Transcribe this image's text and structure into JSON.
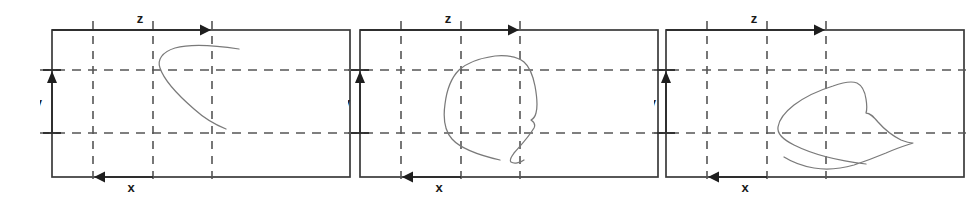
{
  "figure": {
    "title": "",
    "background_color": "#ffffff",
    "panel_count": 3,
    "frame_color": "#3a3a3a",
    "grid_color": "#555555",
    "axis_color": "#2e2e2e",
    "trace_color": "#7a7a7a"
  },
  "axes": {
    "z_label": "z",
    "y_label": "y",
    "x_label": "x",
    "z_icon": "arrow-right-icon",
    "y_icon": "arrow-up-icon",
    "x_icon": "arrow-left-icon"
  },
  "panels": [
    {
      "id": "panel-1",
      "index": 1,
      "z_label": "z",
      "y_label": "y",
      "x_label": "x",
      "trace_name": "hook-trace",
      "trace_path": "M 199 49 C 180 46 152 43 135 48 C 122 52 117 60 120 68 C 124 80 139 96 154 109 C 165 119 176 125 186 129"
    },
    {
      "id": "panel-2",
      "index": 2,
      "z_label": "z",
      "y_label": "y",
      "x_label": "x",
      "trace_name": "loop-trace",
      "trace_path": "M 152 160 C 130 155 113 149 104 139 C 96 130 95 118 97 104 C 99 88 104 77 111 70 C 120 62 133 58 147 56 C 160 55 170 57 176 62 C 182 67 185 76 187 86 C 189 97 190 106 188 113 C 187 117 185 119 183 120 C 186 122 188 124 186 128 C 180 138 172 146 166 153 C 163 157 161 160 163 162 C 166 164 172 163 176 160"
    },
    {
      "id": "panel-3",
      "index": 3,
      "z_label": "z",
      "y_label": "y",
      "x_label": "x",
      "trace_name": "tilted-blob-trace",
      "trace_path": "M 212 164 C 186 161 158 154 140 145 C 128 139 123 133 124 127 C 125 120 131 112 140 105 C 152 96 166 90 179 86 C 190 82 198 81 203 83 C 209 86 211 92 212 99 C 213 105 213 110 212 113 C 216 113 219 116 224 122 C 231 130 239 136 247 140 C 252 142 256 143 259 143 C 253 145 243 148 232 153 C 220 158 209 162 200 165 C 186 169 172 170 160 168 C 148 166 138 162 130 157"
    }
  ],
  "geometry": {
    "frame": {
      "left": 12,
      "top": 30,
      "right": 310,
      "bottom": 177
    },
    "grid_vertical_x": [
      53,
      113,
      172
    ],
    "grid_horizontal_y": [
      70,
      133
    ],
    "z_arrow": {
      "from_x": 12,
      "to_x": 172,
      "y": 30
    },
    "y_arrow": {
      "x": 12,
      "from_y": 133,
      "to_y": 70
    },
    "x_arrow": {
      "from_x": 113,
      "to_x": 53,
      "y": 177
    }
  }
}
